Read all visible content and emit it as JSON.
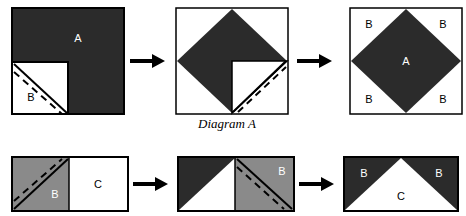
{
  "figure": {
    "caption_diagram_a": "Diagram A",
    "colors": {
      "dark": "#2b2b2b",
      "gray": "#8a8a8a",
      "white": "#ffffff",
      "outline": "#000000",
      "label_light": "#ffffff",
      "label_dark": "#000000",
      "arrow": "#000000",
      "background": "#ffffff"
    }
  },
  "row_top": {
    "name": "diagram-a-sequence",
    "steps": [
      {
        "id": "top-step-1",
        "shape": "square-with-corner-notch",
        "labels": [
          {
            "text": "A",
            "color": "light",
            "x": 78,
            "y": 38
          },
          {
            "text": "B",
            "color": "dark",
            "x": 31,
            "y": 96
          }
        ],
        "has_solid_diagonal": true,
        "has_dashed_fold_line": true
      },
      {
        "id": "top-step-2",
        "shape": "diamond-with-notch",
        "labels": [],
        "has_solid_diagonal": true,
        "has_dashed_fold_line": true
      },
      {
        "id": "top-step-3",
        "shape": "full-diamond-in-square",
        "labels": [
          {
            "text": "A",
            "color": "light",
            "x": 406,
            "y": 62
          },
          {
            "text": "B",
            "color": "dark",
            "x": 368,
            "y": 24
          },
          {
            "text": "B",
            "color": "dark",
            "x": 441,
            "y": 24
          },
          {
            "text": "B",
            "color": "dark",
            "x": 368,
            "y": 99
          },
          {
            "text": "B",
            "color": "dark",
            "x": 441,
            "y": 99
          }
        ],
        "has_solid_diagonal": false,
        "has_dashed_fold_line": false
      }
    ],
    "arrows": [
      {
        "id": "top-arrow-1",
        "x": 130,
        "y": 60
      },
      {
        "id": "top-arrow-2",
        "x": 297,
        "y": 60
      }
    ]
  },
  "row_bottom": {
    "name": "diagram-b-sequence",
    "steps": [
      {
        "id": "bottom-step-1",
        "shape": "rectangle-gray-left-white-right",
        "labels": [
          {
            "text": "B",
            "color": "light",
            "x": 55,
            "y": 194
          },
          {
            "text": "C",
            "color": "dark",
            "x": 98,
            "y": 180
          }
        ],
        "has_solid_diagonal": true,
        "has_dashed_fold_line": true
      },
      {
        "id": "bottom-step-2",
        "shape": "rectangle-folded-triangle-left-gray-right",
        "labels": [
          {
            "text": "B",
            "color": "light",
            "x": 282,
            "y": 171
          }
        ],
        "has_solid_diagonal": true,
        "has_dashed_fold_line": true
      },
      {
        "id": "bottom-step-3",
        "shape": "rectangle-white-triangle-dark-corners",
        "labels": [
          {
            "text": "B",
            "color": "light",
            "x": 353,
            "y": 172
          },
          {
            "text": "B",
            "color": "light",
            "x": 437,
            "y": 172
          },
          {
            "text": "C",
            "color": "dark",
            "x": 396,
            "y": 195
          }
        ],
        "has_solid_diagonal": false,
        "has_dashed_fold_line": false
      }
    ],
    "arrows": [
      {
        "id": "bottom-arrow-1",
        "x": 133,
        "y": 184
      },
      {
        "id": "bottom-arrow-2",
        "x": 299,
        "y": 184
      }
    ]
  }
}
